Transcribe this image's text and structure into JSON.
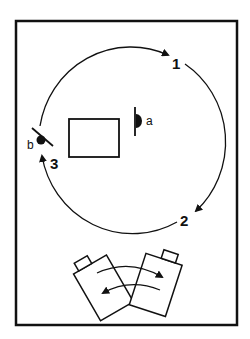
{
  "diagram": {
    "type": "camera-path-schematic",
    "colors": {
      "ink": "#111111",
      "background": "#ffffff"
    },
    "frame": {
      "x": 16,
      "y": 21,
      "width": 221,
      "height": 304
    },
    "path": {
      "shape": "circle",
      "center": [
        129,
        139
      ],
      "radius": 93,
      "direction": "clockwise",
      "positions": [
        {
          "label": "1",
          "x": 173,
          "y": 68
        },
        {
          "label": "2",
          "x": 180,
          "y": 224
        },
        {
          "label": "3",
          "x": 50,
          "y": 170
        }
      ]
    },
    "table": {
      "label": "",
      "x": 69,
      "y": 119,
      "width": 50,
      "height": 38
    },
    "subjects": [
      {
        "label": "a",
        "x": 146,
        "y": 124
      },
      {
        "label": "b",
        "x": 28,
        "y": 148
      }
    ],
    "cameras": {
      "count": 2,
      "annotation": "cameras swap positions (bidirectional arrows)"
    }
  }
}
